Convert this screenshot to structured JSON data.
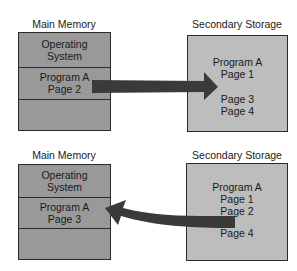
{
  "colors": {
    "main_memory_fill": "#999999",
    "secondary_storage_fill": "#bdbdbd",
    "arrow": "#3a3a3a",
    "outline": "#2a2a2a"
  },
  "panels": [
    {
      "main_memory": {
        "title": "Main Memory",
        "slots": [
          {
            "line1": "Operating",
            "line2": "System"
          },
          {
            "line1": "Program A",
            "line2": "Page 2"
          },
          {
            "line1": "",
            "line2": ""
          }
        ]
      },
      "secondary_storage": {
        "title": "Secondary Storage",
        "lines_top": [
          "Program A",
          "Page 1"
        ],
        "lines_bottom": [
          "Page 3",
          "Page 4"
        ]
      },
      "arrow": {
        "direction": "main-to-secondary",
        "meaning": "page out Page 2"
      }
    },
    {
      "main_memory": {
        "title": "Main Memory",
        "slots": [
          {
            "line1": "Operating",
            "line2": "System"
          },
          {
            "line1": "Program A",
            "line2": "Page 3"
          },
          {
            "line1": "",
            "line2": ""
          }
        ]
      },
      "secondary_storage": {
        "title": "Secondary Storage",
        "lines_top": [
          "Program A",
          "Page 1",
          "Page 2"
        ],
        "lines_bottom": [
          "Page 4"
        ]
      },
      "arrow": {
        "direction": "secondary-to-main",
        "meaning": "page in Page 3"
      }
    }
  ]
}
